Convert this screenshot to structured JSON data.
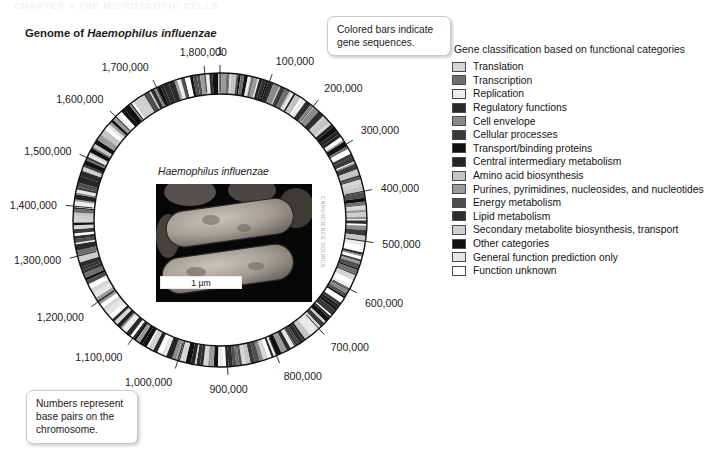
{
  "page_header": "CHAPTER 4   THE MICROSCOPIC CELLS",
  "figure": {
    "title_prefix": "Genome of ",
    "title_species": "Haemophilus influenzae"
  },
  "callouts": {
    "bars": "Colored bars indicate gene sequences.",
    "numbers": "Numbers represent base pairs on the chromosome."
  },
  "genome": {
    "origin_label": "1",
    "ticks": [
      {
        "label": "1",
        "value": 1
      },
      {
        "label": "100,000",
        "value": 100000
      },
      {
        "label": "200,000",
        "value": 200000
      },
      {
        "label": "300,000",
        "value": 300000
      },
      {
        "label": "400,000",
        "value": 400000
      },
      {
        "label": "500,000",
        "value": 500000
      },
      {
        "label": "600,000",
        "value": 600000
      },
      {
        "label": "700,000",
        "value": 700000
      },
      {
        "label": "800,000",
        "value": 800000
      },
      {
        "label": "900,000",
        "value": 900000
      },
      {
        "label": "1,000,000",
        "value": 1000000
      },
      {
        "label": "1,100,000",
        "value": 1100000
      },
      {
        "label": "1,200,000",
        "value": 1200000
      },
      {
        "label": "1,300,000",
        "value": 1300000
      },
      {
        "label": "1,400,000",
        "value": 1400000
      },
      {
        "label": "1,500,000",
        "value": 1500000
      },
      {
        "label": "1,600,000",
        "value": 1600000
      },
      {
        "label": "1,700,000",
        "value": 1700000
      },
      {
        "label": "1,800,000",
        "value": 1800000
      }
    ]
  },
  "inset": {
    "caption": "Haemophilus influenzae",
    "scalebar": "1 µm",
    "credit": "CNRI/SCIENCE SOURCE"
  },
  "legend": {
    "title": "Gene classification based on functional categories",
    "items": [
      {
        "label": "Translation",
        "color": "#d6d6d6"
      },
      {
        "label": "Transcription",
        "color": "#6e6e6e"
      },
      {
        "label": "Replication",
        "color": "#ececec"
      },
      {
        "label": "Regulatory functions",
        "color": "#2b2b2b"
      },
      {
        "label": "Cell envelope",
        "color": "#8a8a8a"
      },
      {
        "label": "Cellular processes",
        "color": "#3a3a3a"
      },
      {
        "label": "Transport/binding proteins",
        "color": "#111111"
      },
      {
        "label": "Central intermediary metabolism",
        "color": "#252525"
      },
      {
        "label": "Amino acid biosynthesis",
        "color": "#c4c4c4"
      },
      {
        "label": "Purines, pyrimidines, nucleosides, and nucleotides",
        "color": "#9a9a9a"
      },
      {
        "label": "Energy metabolism",
        "color": "#4f4f4f"
      },
      {
        "label": "Lipid metabolism",
        "color": "#2e2e2e"
      },
      {
        "label": "Secondary metabolite biosynthesis, transport",
        "color": "#cfcfcf"
      },
      {
        "label": "Other categories",
        "color": "#101010"
      },
      {
        "label": "General function prediction only",
        "color": "#e6e6e6"
      },
      {
        "label": "Function unknown",
        "color": "#ffffff"
      }
    ]
  },
  "chart_data": {
    "type": "pie",
    "title": "Genome of Haemophilus influenzae",
    "total_base_pairs": 1830000,
    "axis_unit": "base pairs",
    "tick_interval": 100000,
    "tick_values": [
      1,
      100000,
      200000,
      300000,
      400000,
      500000,
      600000,
      700000,
      800000,
      900000,
      1000000,
      1100000,
      1200000,
      1300000,
      1400000,
      1500000,
      1600000,
      1700000,
      1800000
    ],
    "categories": [
      "Translation",
      "Transcription",
      "Replication",
      "Regulatory functions",
      "Cell envelope",
      "Cellular processes",
      "Transport/binding proteins",
      "Central intermediary metabolism",
      "Amino acid biosynthesis",
      "Purines, pyrimidines, nucleosides, and nucleotides",
      "Energy metabolism",
      "Lipid metabolism",
      "Secondary metabolite biosynthesis, transport",
      "Other categories",
      "General function prediction only",
      "Function unknown"
    ],
    "grid": false,
    "legend_position": "right"
  }
}
